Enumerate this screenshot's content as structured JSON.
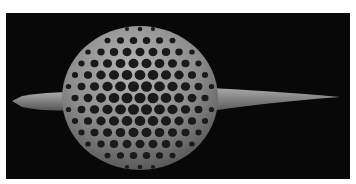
{
  "image": {
    "subject": "radiolarian-sem",
    "description": "Scanning electron micrograph of a spherical, lattice-shelled radiolarian with two opposing spines",
    "background_color": "#080808",
    "specimen_color": "#8a8a8a"
  }
}
